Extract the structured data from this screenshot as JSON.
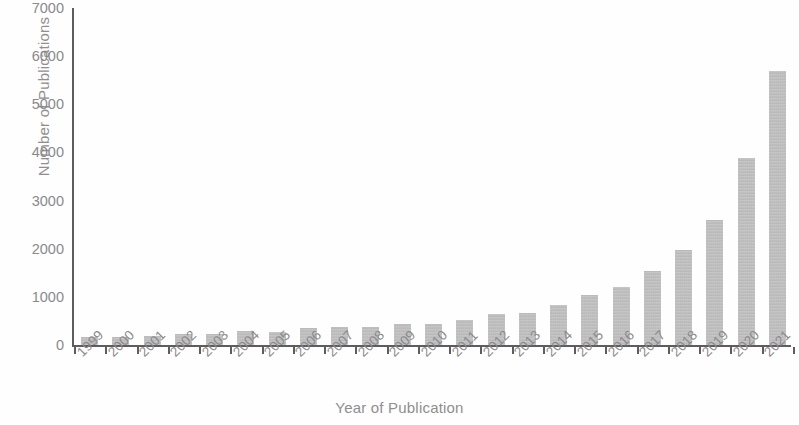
{
  "chart_data": {
    "type": "bar",
    "title": "",
    "xlabel": "Year of Publication",
    "ylabel": "Number of Publications",
    "categories": [
      "1999",
      "2000",
      "2001",
      "2002",
      "2003",
      "2004",
      "2005",
      "2006",
      "2007",
      "2008",
      "2009",
      "2010",
      "2011",
      "2012",
      "2013",
      "2014",
      "2015",
      "2016",
      "2017",
      "2018",
      "2019",
      "2020",
      "2021"
    ],
    "values": [
      175,
      165,
      195,
      225,
      235,
      290,
      275,
      345,
      370,
      375,
      440,
      445,
      510,
      635,
      655,
      840,
      1035,
      1215,
      1540,
      1980,
      2590,
      3890,
      5690
    ],
    "series": [
      {
        "name": "Number of Publications",
        "values": [
          175,
          165,
          195,
          225,
          235,
          290,
          275,
          345,
          370,
          375,
          440,
          445,
          510,
          635,
          655,
          840,
          1035,
          1215,
          1540,
          1980,
          2590,
          3890,
          5690
        ]
      }
    ],
    "ylim": [
      0,
      7000
    ],
    "y_ticks": [
      0,
      1000,
      2000,
      3000,
      4000,
      5000,
      6000,
      7000
    ],
    "y_tick_labels": [
      "0",
      "1000",
      "2000",
      "3000",
      "4000",
      "5000",
      "6000",
      "7000"
    ],
    "grid": false,
    "legend": false,
    "legend_position": "none",
    "bar_color": "#bcbcbc",
    "axis_color": "#5d5d5d",
    "label_color": "#8a8a8a",
    "background_color": "#ffffff",
    "x_tick_label_rotation": -45
  }
}
